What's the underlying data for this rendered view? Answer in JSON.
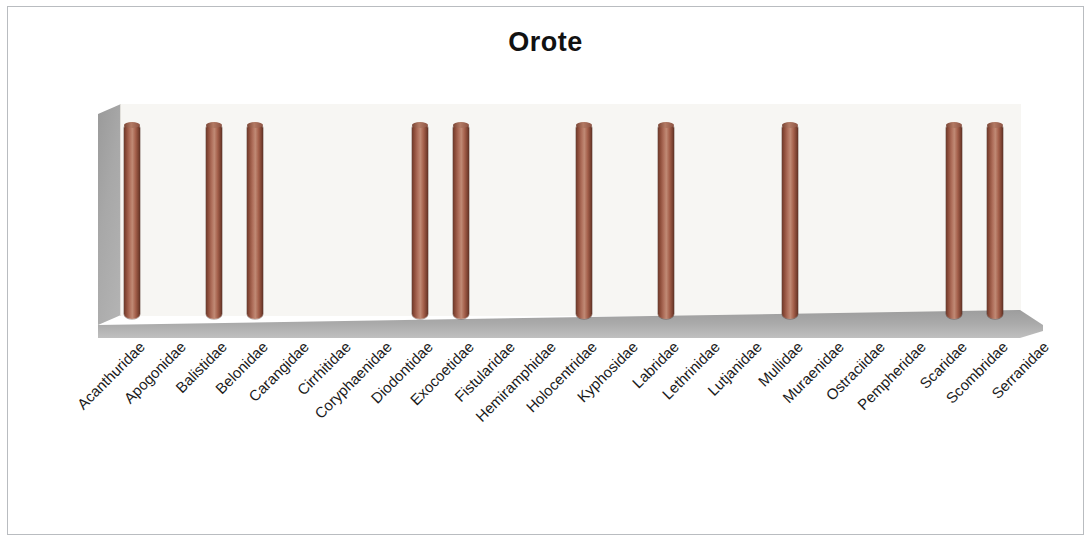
{
  "chart_title": "Orote",
  "chart_data": {
    "type": "bar",
    "title": "Orote",
    "xlabel": "",
    "ylabel": "",
    "ylim": [
      0,
      1
    ],
    "grid": false,
    "legend": "none",
    "style": "3d-cylinder",
    "bar_color": "#a5614c",
    "categories": [
      "Acanthuridae",
      "Apogonidae",
      "Balistidae",
      "Belonidae",
      "Carangidae",
      "Cirrhitidae",
      "Coryphaenidae",
      "Diodontidae",
      "Exocoetidae",
      "Fistularidae",
      "Hemiramphidae",
      "Holocentridae",
      "Kyphosidae",
      "Labridae",
      "Lethrinidae",
      "Lutjanidae",
      "Mullidae",
      "Muraenidae",
      "Ostraciidae",
      "Pempheridae",
      "Scaridae",
      "Scombridae",
      "Serranidae"
    ],
    "values": [
      1,
      0,
      1,
      1,
      0,
      0,
      0,
      1,
      1,
      0,
      0,
      1,
      0,
      1,
      0,
      0,
      1,
      0,
      0,
      0,
      1,
      1,
      0
    ]
  }
}
